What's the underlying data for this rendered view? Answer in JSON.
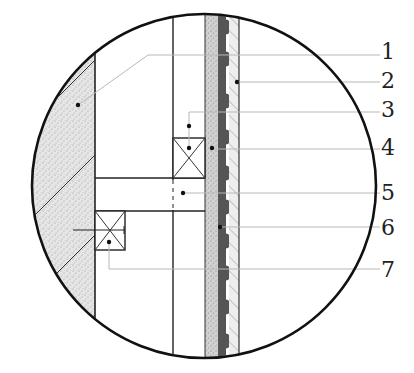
{
  "drawing": {
    "type": "construction-detail-section",
    "circle": {
      "cx": 204,
      "cy": 186,
      "r": 172,
      "stroke": "#111111"
    },
    "colors": {
      "line": "#222222",
      "leader": "#b8b8b8",
      "concrete_fill": "#e4e4e4",
      "speckle_fill": "#cfcfcf",
      "membrane_fill": "#555555",
      "hatch_fill": "#ececec",
      "background": "#ffffff"
    }
  },
  "callouts": [
    {
      "id": 1,
      "label": "1",
      "y": 51
    },
    {
      "id": 2,
      "label": "2",
      "y": 79
    },
    {
      "id": 3,
      "label": "3",
      "y": 108
    },
    {
      "id": 4,
      "label": "4",
      "y": 146
    },
    {
      "id": 5,
      "label": "5",
      "y": 193
    },
    {
      "id": 6,
      "label": "6",
      "y": 227
    },
    {
      "id": 7,
      "label": "7",
      "y": 269
    }
  ]
}
